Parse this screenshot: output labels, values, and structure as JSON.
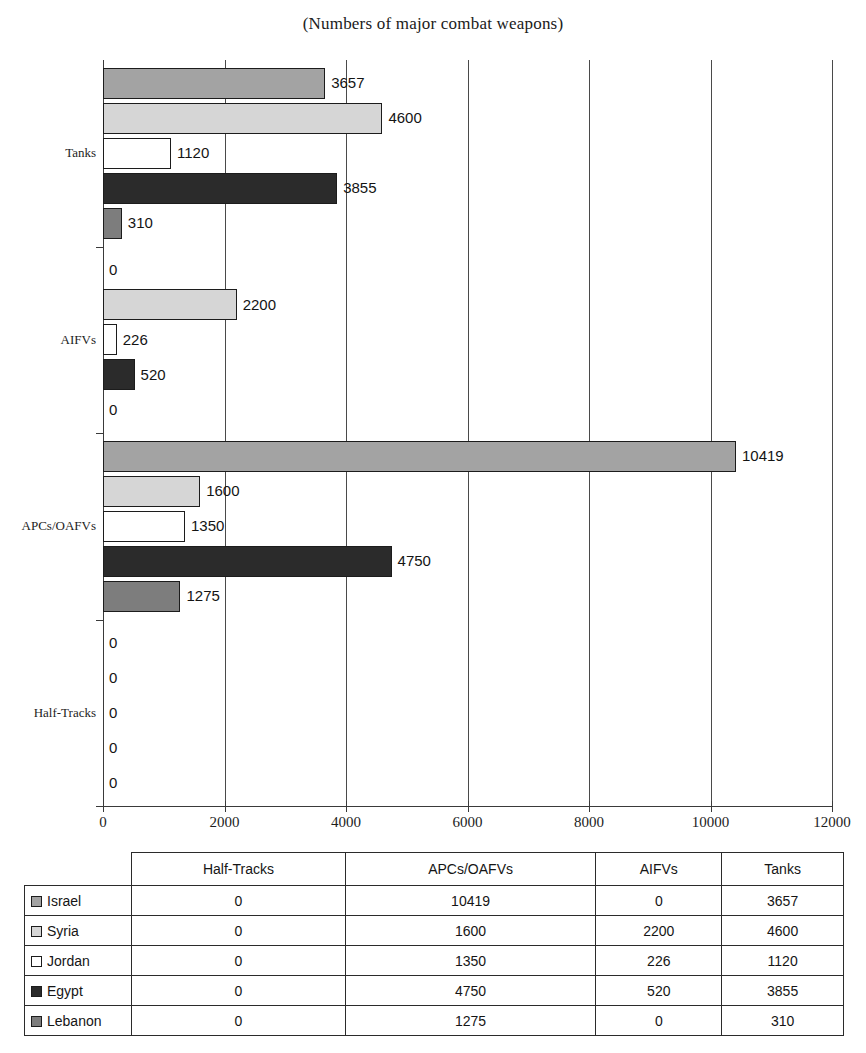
{
  "chart_data": {
    "type": "bar",
    "orientation": "horizontal",
    "title": "(Numbers of major combat weapons)",
    "xlabel": "",
    "ylabel": "",
    "xlim": [
      0,
      12000
    ],
    "xticks": [
      0,
      2000,
      4000,
      6000,
      8000,
      10000,
      12000
    ],
    "xtick_labels": [
      "0",
      "2000",
      "4000",
      "6000",
      "8000",
      "10000",
      "12000"
    ],
    "grid": true,
    "grid_axis": "x",
    "legend_position": "table-below",
    "categories": [
      "Tanks",
      "AIFVs",
      "APCs/OAFVs",
      "Half-Tracks"
    ],
    "series": [
      {
        "name": "Israel",
        "color": "#a3a3a3",
        "values": [
          3657,
          0,
          10419,
          0
        ]
      },
      {
        "name": "Syria",
        "color": "#d6d6d6",
        "values": [
          4600,
          2200,
          1600,
          0
        ]
      },
      {
        "name": "Jordan",
        "color": "#ffffff",
        "values": [
          1120,
          226,
          1350,
          0
        ]
      },
      {
        "name": "Egypt",
        "color": "#2b2b2b",
        "values": [
          3855,
          520,
          4750,
          0
        ]
      },
      {
        "name": "Lebanon",
        "color": "#7d7d7d",
        "values": [
          310,
          0,
          1275,
          0
        ]
      }
    ],
    "data_labels": {
      "Tanks": [
        "3657",
        "4600",
        "1120",
        "3855",
        "310"
      ],
      "AIFVs": [
        "0",
        "2200",
        "226",
        "520",
        "0"
      ],
      "APCs/OAFVs": [
        "10419",
        "1600",
        "1350",
        "4750",
        "1275"
      ],
      "Half-Tracks": [
        "0",
        "0",
        "0",
        "0",
        "0"
      ]
    }
  },
  "table": {
    "corner_label": "",
    "columns": [
      "Half-Tracks",
      "APCs/OAFVs",
      "AIFVs",
      "Tanks"
    ],
    "rows": [
      {
        "label": "Israel",
        "swatch": "#a3a3a3",
        "values": [
          "0",
          "10419",
          "0",
          "3657"
        ]
      },
      {
        "label": "Syria",
        "swatch": "#d6d6d6",
        "values": [
          "0",
          "1600",
          "2200",
          "4600"
        ]
      },
      {
        "label": "Jordan",
        "swatch": "#ffffff",
        "values": [
          "0",
          "1350",
          "226",
          "1120"
        ]
      },
      {
        "label": "Egypt",
        "swatch": "#2b2b2b",
        "values": [
          "0",
          "4750",
          "520",
          "3855"
        ]
      },
      {
        "label": "Lebanon",
        "swatch": "#7d7d7d",
        "values": [
          "0",
          "1275",
          "0",
          "310"
        ]
      }
    ]
  }
}
